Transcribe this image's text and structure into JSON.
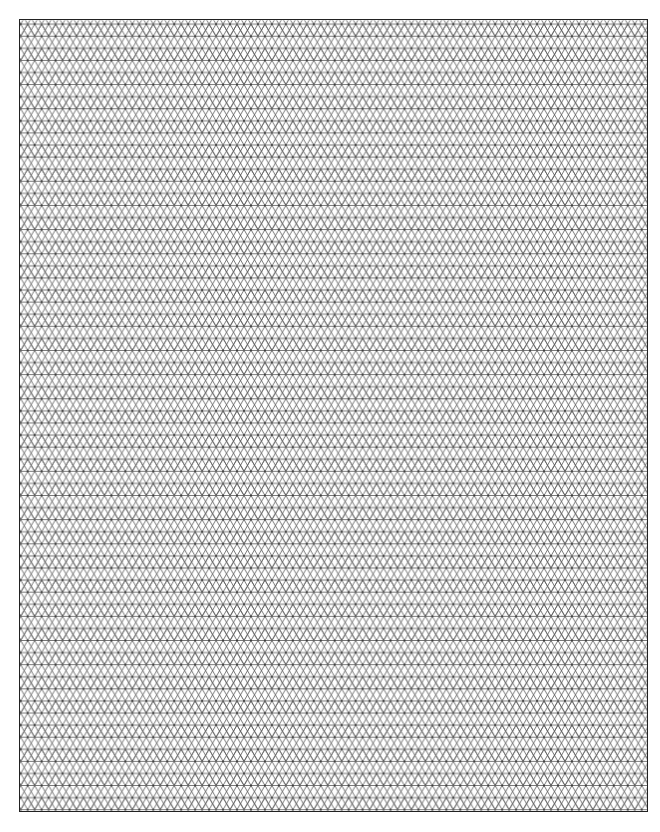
{
  "page": {
    "title": "Isometric Grid Paper",
    "background_color": "#ffffff"
  },
  "grid": {
    "type": "isometric-triangle",
    "description": "Isometric (triangular) graph paper",
    "triangle_side_px": 14,
    "row_height_px": 12.12,
    "line_color": "#555555",
    "line_width_px": 0.8,
    "frame_color": "#222222",
    "frame_width_px": 1.6,
    "frame": {
      "left": 19,
      "top": 19,
      "width": 629,
      "height": 793
    },
    "approx_rows": 65,
    "approx_columns": 45
  }
}
